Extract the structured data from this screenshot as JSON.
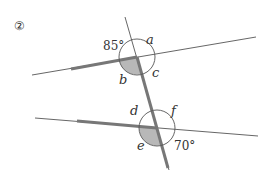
{
  "problem_number": "②",
  "labels": {
    "a": "a",
    "b": "b",
    "c": "c",
    "d": "d",
    "e": "e",
    "f": "f"
  },
  "angles": {
    "upper_given": "85°",
    "lower_given": "70°"
  },
  "colors": {
    "line": "#555555",
    "thick_line": "#777777",
    "shade": "#b8b8b8",
    "text": "#333333"
  }
}
